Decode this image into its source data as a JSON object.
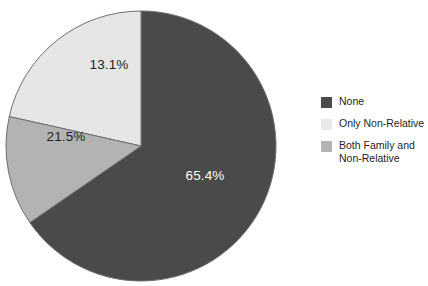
{
  "chart_data": {
    "type": "pie",
    "title": "",
    "xlabel": "",
    "ylabel": "",
    "categories": [
      "None",
      "Only Non-Relative",
      "Both Family and Non-Relative"
    ],
    "values": [
      65.4,
      21.5,
      13.1
    ],
    "value_labels": [
      "65.4%",
      "21.5%",
      "13.1%"
    ],
    "colors": [
      "#4a4a4a",
      "#e6e6e6",
      "#b3b3b3"
    ],
    "label_text_colors": [
      "#ffffff",
      "#231f20",
      "#231f20"
    ],
    "units": "percent",
    "legend_position": "right",
    "grid": false,
    "start_angle_deg": 0,
    "direction": "clockwise-for-first-slice"
  },
  "figure": {
    "background": "#ffffff",
    "outline_color": "#6e6e6e"
  },
  "pie": {
    "center_x": 141,
    "center_y": 146,
    "radius": 135,
    "slices": [
      {
        "name": "None",
        "label": "65.4%",
        "percent": 65.4,
        "color": "#4a4a4a",
        "label_color": "#ffffff",
        "label_x": 205,
        "label_y": 180
      },
      {
        "name": "Only Non-Relative",
        "label": "21.5%",
        "percent": 21.5,
        "color": "#e6e6e6",
        "label_color": "#231f20",
        "label_x": 66,
        "label_y": 141
      },
      {
        "name": "Both Family and Non-Relative",
        "label": "13.1%",
        "percent": 13.1,
        "color": "#b3b3b3",
        "label_color": "#231f20",
        "label_x": 109,
        "label_y": 69
      }
    ]
  },
  "legend": {
    "items": [
      {
        "label": "None",
        "color": "#4a4a4a"
      },
      {
        "label": "Only Non-Relative",
        "color": "#e9e9e9"
      },
      {
        "label": "Both Family and\nNon-Relative",
        "color": "#b3b3b3"
      }
    ]
  }
}
